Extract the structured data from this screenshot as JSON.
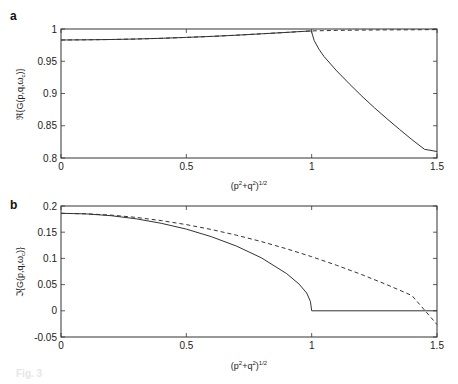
{
  "figure": {
    "caption_fragment": "Fig. 3"
  },
  "chart_data": [
    {
      "panel": "a",
      "type": "line",
      "title": "",
      "xlabel": "(p²+q²)¹ᐟ²",
      "xlabel_text": "(p2+q2)1/2",
      "ylabel": "ℜ{G(p,q,ωc)}",
      "xlim": [
        0,
        1.5
      ],
      "ylim": [
        0.8,
        1.0
      ],
      "xticks": [
        0,
        0.5,
        1,
        1.5
      ],
      "xtick_labels": [
        "0",
        "0.5",
        "1",
        "1.5"
      ],
      "yticks": [
        0.8,
        0.85,
        0.9,
        0.95,
        1.0
      ],
      "ytick_labels": [
        "0.8",
        "0.85",
        "0.9",
        "0.95",
        "1"
      ],
      "grid": false,
      "legend": null,
      "series": [
        {
          "name": "solid",
          "style": "solid",
          "x": [
            0,
            0.1,
            0.2,
            0.3,
            0.4,
            0.5,
            0.6,
            0.7,
            0.8,
            0.9,
            0.95,
            1.0,
            1.001,
            1.01,
            1.03,
            1.05,
            1.1,
            1.15,
            1.2,
            1.25,
            1.3,
            1.35,
            1.4,
            1.45,
            1.5
          ],
          "y": [
            0.983,
            0.9832,
            0.9837,
            0.9845,
            0.9856,
            0.987,
            0.9886,
            0.9904,
            0.9925,
            0.9948,
            0.996,
            0.997,
            0.994,
            0.982,
            0.968,
            0.957,
            0.935,
            0.915,
            0.896,
            0.878,
            0.861,
            0.8445,
            0.8285,
            0.8135,
            0.81
          ]
        },
        {
          "name": "dashed",
          "style": "dashed",
          "x": [
            0,
            0.1,
            0.2,
            0.3,
            0.4,
            0.5,
            0.6,
            0.7,
            0.8,
            0.9,
            1.0,
            1.1,
            1.2,
            1.3,
            1.4,
            1.5
          ],
          "y": [
            0.983,
            0.9832,
            0.9837,
            0.9845,
            0.9856,
            0.987,
            0.9886,
            0.9904,
            0.9925,
            0.9948,
            0.997,
            0.9978,
            0.9983,
            0.9986,
            0.9988,
            0.999
          ]
        }
      ]
    },
    {
      "panel": "b",
      "type": "line",
      "title": "",
      "xlabel_text": "(p2+q2)1/2",
      "ylabel": "ℑ{G(p,q,ωc)}",
      "xlim": [
        0,
        1.5
      ],
      "ylim": [
        -0.05,
        0.2
      ],
      "xticks": [
        0,
        0.5,
        1,
        1.5
      ],
      "xtick_labels": [
        "0",
        "0.5",
        "1",
        "1.5"
      ],
      "yticks": [
        -0.05,
        0,
        0.05,
        0.1,
        0.15,
        0.2
      ],
      "ytick_labels": [
        "-0.05",
        "0",
        "0.05",
        "0.1",
        "0.15",
        "0.2"
      ],
      "grid": false,
      "legend": null,
      "series": [
        {
          "name": "solid",
          "style": "solid",
          "x": [
            0,
            0.1,
            0.2,
            0.3,
            0.4,
            0.5,
            0.6,
            0.7,
            0.8,
            0.9,
            0.95,
            0.98,
            0.995,
            1.0,
            1.0,
            1.5
          ],
          "y": [
            0.186,
            0.185,
            0.1815,
            0.1755,
            0.167,
            0.156,
            0.1415,
            0.1235,
            0.101,
            0.071,
            0.051,
            0.034,
            0.018,
            0.0,
            0.0,
            0.0
          ]
        },
        {
          "name": "dashed",
          "style": "dashed",
          "x": [
            0,
            0.1,
            0.2,
            0.3,
            0.4,
            0.5,
            0.6,
            0.7,
            0.8,
            0.9,
            1.0,
            1.1,
            1.2,
            1.3,
            1.4,
            1.5
          ],
          "y": [
            0.186,
            0.1852,
            0.1826,
            0.1782,
            0.1722,
            0.1645,
            0.1552,
            0.1443,
            0.132,
            0.1183,
            0.1032,
            0.0868,
            0.069,
            0.0498,
            0.0292,
            -0.0262
          ]
        }
      ]
    }
  ]
}
